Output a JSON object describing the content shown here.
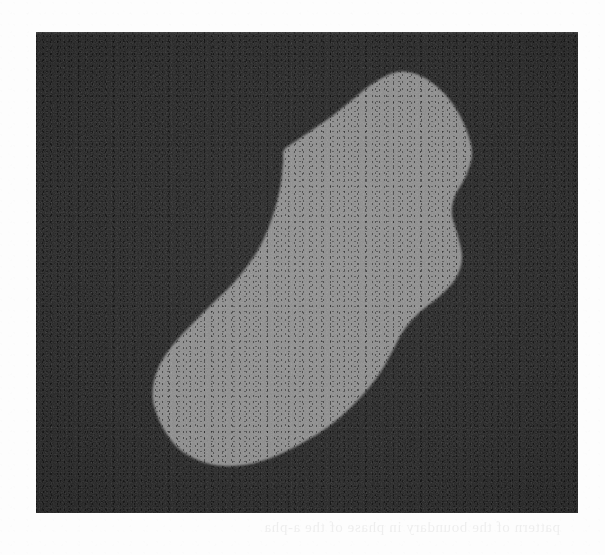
{
  "page": {
    "background_color": "#fdfdfd",
    "width": 605,
    "height": 555,
    "caption_ghost": {
      "note": "faint reversed bleed-through text from the reverse of the scanned page",
      "line1": "pattern of the boundary in phase of the a-pha",
      "line2": ""
    }
  },
  "figure": {
    "panel": {
      "name": "dark-image-panel",
      "background_color": "#232323",
      "left": 36,
      "top": 32,
      "width": 542,
      "height": 481
    },
    "mask": {
      "name": "segmented-region",
      "fill_color": "#8d8d8d",
      "description": "single elongated kidney/bean shaped bright region tilted from lower-left to upper-right",
      "bounding_box": {
        "left": 152,
        "top": 70,
        "right": 473,
        "bottom": 467
      },
      "apex_top": {
        "x": 397,
        "y": 72
      },
      "leftmost": {
        "x": 153,
        "y": 387
      },
      "rightmost": {
        "x": 472,
        "y": 155
      },
      "bottommost": {
        "x": 224,
        "y": 466
      },
      "outline_points": [
        [
          397,
          72
        ],
        [
          421,
          76
        ],
        [
          443,
          92
        ],
        [
          458,
          112
        ],
        [
          468,
          134
        ],
        [
          472,
          155
        ],
        [
          466,
          176
        ],
        [
          455,
          196
        ],
        [
          452,
          214
        ],
        [
          458,
          236
        ],
        [
          462,
          258
        ],
        [
          456,
          278
        ],
        [
          440,
          296
        ],
        [
          420,
          312
        ],
        [
          404,
          330
        ],
        [
          392,
          352
        ],
        [
          378,
          376
        ],
        [
          358,
          400
        ],
        [
          332,
          424
        ],
        [
          304,
          442
        ],
        [
          276,
          456
        ],
        [
          250,
          464
        ],
        [
          224,
          466
        ],
        [
          200,
          461
        ],
        [
          178,
          448
        ],
        [
          163,
          428
        ],
        [
          154,
          406
        ],
        [
          153,
          387
        ],
        [
          159,
          366
        ],
        [
          172,
          346
        ],
        [
          190,
          326
        ],
        [
          212,
          304
        ],
        [
          236,
          280
        ],
        [
          258,
          250
        ],
        [
          272,
          218
        ],
        [
          280,
          188
        ],
        [
          283,
          162
        ],
        [
          284,
          150
        ],
        [
          296,
          141
        ],
        [
          312,
          130
        ],
        [
          332,
          116
        ],
        [
          352,
          100
        ],
        [
          372,
          84
        ]
      ]
    }
  },
  "chart_data": {
    "type": "heatmap",
    "title": "",
    "xlabel": "",
    "ylabel": "",
    "levels": [
      {
        "name": "background",
        "gray_value": 35,
        "hex": "#232323",
        "area_fraction": 0.74
      },
      {
        "name": "foreground-region",
        "gray_value": 141,
        "hex": "#8d8d8d",
        "area_fraction": 0.26
      }
    ],
    "image_extent": {
      "x": [
        0,
        542
      ],
      "y": [
        0,
        481
      ]
    },
    "grid": false,
    "legend": "none"
  }
}
